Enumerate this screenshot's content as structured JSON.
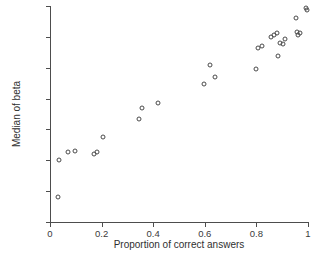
{
  "chart_data": {
    "type": "scatter",
    "title": "",
    "xlabel": "Proportion of correct answers",
    "ylabel": "Median of beta",
    "xlim": [
      0,
      1
    ],
    "ylim": [
      -0.8,
      0.6
    ],
    "xticks": [
      0,
      0.2,
      0.4,
      0.6,
      0.8,
      1
    ],
    "xtick_labels": [
      "0",
      "0.2",
      "0.4",
      "0.6",
      "0.8",
      "1"
    ],
    "yticks": [
      0.6,
      0.4,
      0.2,
      0,
      -0.2,
      -0.4,
      -0.6,
      -0.8
    ],
    "ytick_labels": [
      "0.6",
      "0.4",
      "0.2",
      "0",
      "−0.2",
      "−0.4",
      "−0.6",
      "−0.8"
    ],
    "grid": false,
    "legend": null,
    "marker": "open-circle",
    "marker_color": "#4a4a4a",
    "points": [
      {
        "x": 0.03,
        "y": -0.64
      },
      {
        "x": 0.035,
        "y": -0.4
      },
      {
        "x": 0.07,
        "y": -0.348
      },
      {
        "x": 0.098,
        "y": -0.338
      },
      {
        "x": 0.172,
        "y": -0.362
      },
      {
        "x": 0.182,
        "y": -0.348
      },
      {
        "x": 0.205,
        "y": -0.25
      },
      {
        "x": 0.345,
        "y": -0.135
      },
      {
        "x": 0.358,
        "y": -0.062
      },
      {
        "x": 0.42,
        "y": -0.028
      },
      {
        "x": 0.598,
        "y": 0.094
      },
      {
        "x": 0.622,
        "y": 0.215
      },
      {
        "x": 0.638,
        "y": 0.142
      },
      {
        "x": 0.8,
        "y": 0.192
      },
      {
        "x": 0.808,
        "y": 0.33
      },
      {
        "x": 0.822,
        "y": 0.34
      },
      {
        "x": 0.855,
        "y": 0.398
      },
      {
        "x": 0.868,
        "y": 0.41
      },
      {
        "x": 0.878,
        "y": 0.422
      },
      {
        "x": 0.885,
        "y": 0.278
      },
      {
        "x": 0.89,
        "y": 0.362
      },
      {
        "x": 0.902,
        "y": 0.352
      },
      {
        "x": 0.912,
        "y": 0.388
      },
      {
        "x": 0.952,
        "y": 0.525
      },
      {
        "x": 0.958,
        "y": 0.43
      },
      {
        "x": 0.962,
        "y": 0.412
      },
      {
        "x": 0.968,
        "y": 0.425
      },
      {
        "x": 0.992,
        "y": 0.585
      },
      {
        "x": 0.996,
        "y": 0.575
      }
    ]
  }
}
